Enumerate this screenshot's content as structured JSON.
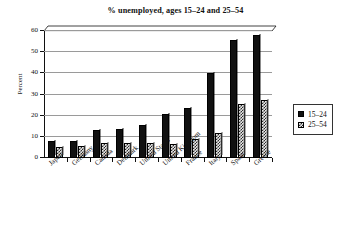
{
  "chart_data": {
    "type": "bar",
    "title": "% unemployed, ages 15–24 and 25–54",
    "xlabel": "",
    "ylabel": "Percent",
    "ylim": [
      0,
      60
    ],
    "yticks": [
      0,
      10,
      20,
      30,
      40,
      50,
      60
    ],
    "ytick_labels": [
      "0",
      "10",
      "20",
      "30",
      "40",
      "50",
      "60"
    ],
    "grid": true,
    "legend_position": "right",
    "categories": [
      "Japan",
      "Germany",
      "Canada",
      "Denmark",
      "United States",
      "United Kingdom",
      "France",
      "Italy",
      "Spain",
      "Greece"
    ],
    "series": [
      {
        "name": "15–24",
        "fill": "solid-black",
        "color": "#111111",
        "values": [
          8,
          8.2,
          13.2,
          13.6,
          15.5,
          20.6,
          23.8,
          40.2,
          55.8,
          58.2
        ]
      },
      {
        "name": "25–54",
        "fill": "crosshatch",
        "color": "#e8e8e8",
        "values": [
          5,
          5.8,
          7,
          7.2,
          7,
          6.4,
          8.8,
          11.8,
          25.4,
          27.4
        ]
      }
    ]
  },
  "legend": {
    "entries": [
      {
        "label": "15–24",
        "swatch": "solid-black-square"
      },
      {
        "label": "25–54",
        "swatch": "crosshatch-square"
      }
    ]
  }
}
